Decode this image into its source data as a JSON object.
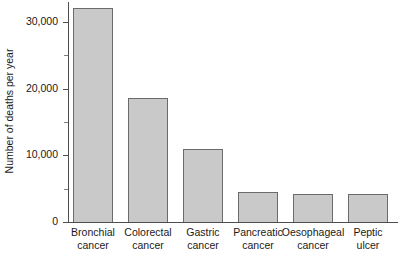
{
  "chart_data": {
    "type": "bar",
    "title": "",
    "xlabel": "",
    "ylabel": "Number of deaths per year",
    "categories": [
      "Bronchial cancer",
      "Colorectal cancer",
      "Gastric cancer",
      "Pancreatic cancer",
      "Oesophageal cancer",
      "Peptic ulcer"
    ],
    "category_lines": [
      [
        "Bronchial",
        "cancer"
      ],
      [
        "Colorectal",
        "cancer"
      ],
      [
        "Gastric",
        "cancer"
      ],
      [
        "Pancreatic",
        "cancer"
      ],
      [
        "Oesophageal",
        "cancer"
      ],
      [
        "Peptic",
        "ulcer"
      ]
    ],
    "values": [
      32100,
      18600,
      10900,
      4500,
      4200,
      4200
    ],
    "ylim": [
      0,
      32500
    ],
    "ytick_values": [
      0,
      10000,
      20000,
      30000
    ],
    "ytick_labels": [
      "0",
      "10,000",
      "20,000",
      "30,000"
    ],
    "yminor_tick_values": [
      5000,
      15000,
      25000
    ],
    "grid": false,
    "legend": false,
    "bar_color": "#c9c9c9",
    "bar_border_color": "#6b6b6b",
    "axis_color": "#4d4d4d"
  }
}
